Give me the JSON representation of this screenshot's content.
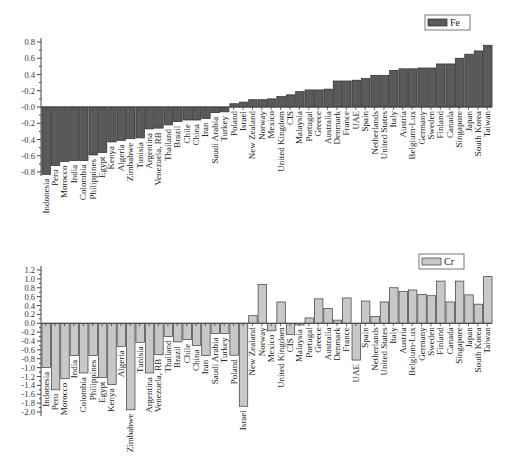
{
  "chart_data": [
    {
      "type": "bar",
      "title": "",
      "xlabel": "",
      "ylabel": "",
      "legend": {
        "label": "Fe",
        "placement": "top-right"
      },
      "color": "#5a5a5a",
      "edge_color": "#2a2a2a",
      "ylim": [
        -0.8,
        0.8
      ],
      "yticks": [
        "0.8",
        "0.6",
        "0.4",
        "-0.2",
        "-0.0",
        "-0.2",
        "-0.4",
        "-0.6",
        "-0.8"
      ],
      "ytick_values": [
        0.8,
        0.6,
        0.4,
        0.2,
        0.0,
        -0.2,
        -0.4,
        -0.6,
        -0.8
      ],
      "grid": false,
      "categories": [
        "Indonesia",
        "Peru",
        "Morocco",
        "India",
        "Colombia",
        "Philippines",
        "Egypt",
        "Kenya",
        "Algeria",
        "Zimbabwe",
        "Tunisia",
        "Argentina",
        "Venezuela, RB",
        "Thailand",
        "Brazil",
        "Chile",
        "China",
        "Iran",
        "Saudi Arabia",
        "Turkey",
        "Poland",
        "Israel",
        "New Zealand",
        "Norway",
        "Mexico",
        "United Kingdom",
        "CIS",
        "Malaysia",
        "Portugal",
        "Greece",
        "Australia",
        "Denmark",
        "France",
        "UAE",
        "Spain",
        "Netherlands",
        "United States",
        "Italy",
        "Austria",
        "Belgium-Lux",
        "Germany",
        "Sweden",
        "Finland",
        "Canada",
        "Singapore",
        "Japan",
        "South Korea",
        "Taiwan"
      ],
      "values": [
        -0.83,
        -0.72,
        -0.67,
        -0.66,
        -0.66,
        -0.59,
        -0.56,
        -0.43,
        -0.41,
        -0.39,
        -0.38,
        -0.27,
        -0.26,
        -0.22,
        -0.18,
        -0.16,
        -0.16,
        -0.14,
        -0.07,
        -0.06,
        0.04,
        0.06,
        0.09,
        0.09,
        0.1,
        0.13,
        0.15,
        0.19,
        0.21,
        0.21,
        0.22,
        0.32,
        0.32,
        0.33,
        0.35,
        0.39,
        0.39,
        0.45,
        0.47,
        0.47,
        0.48,
        0.48,
        0.53,
        0.53,
        0.6,
        0.65,
        0.69,
        0.76
      ]
    },
    {
      "type": "bar",
      "title": "",
      "xlabel": "",
      "ylabel": "",
      "legend": {
        "label": "Cr",
        "placement": "top-right"
      },
      "color": "#c8c8c8",
      "edge_color": "#3a3a3a",
      "ylim": [
        -2.0,
        1.2
      ],
      "yticks": [
        "1.2",
        "1.0",
        "0.8",
        "0.6",
        "0.4",
        "0.2",
        "0.0",
        "-0.2",
        "-0.4",
        "-0.6",
        "-0.8",
        "-1.0",
        "-1.2",
        "-1.4",
        "-1.6",
        "-1.8",
        "-2.0"
      ],
      "ytick_values": [
        1.2,
        1.0,
        0.8,
        0.6,
        0.4,
        0.2,
        0.0,
        -0.2,
        -0.4,
        -0.6,
        -0.8,
        -1.0,
        -1.2,
        -1.4,
        -1.6,
        -1.8,
        -2.0
      ],
      "grid": false,
      "categories": [
        "Indonesia",
        "Peru",
        "Morocco",
        "India",
        "Colombia",
        "Philippines",
        "Egypt",
        "Kenya",
        "Algeria",
        "Zimbabwe",
        "Tunisia",
        "Argentina",
        "Venezuela, RB",
        "Thailand",
        "Brazil",
        "Chile",
        "China",
        "Iran",
        "Saudi Arabia",
        "Turkey",
        "Poland",
        "Israel",
        "New Zealand",
        "Norway",
        "Mexico",
        "United Kingdom",
        "CIS",
        "Malaysia",
        "Portugal",
        "Greece",
        "Australia",
        "Denmark",
        "France",
        "UAE",
        "Spain",
        "Netherlands",
        "United States",
        "Italy",
        "Austria",
        "Belgium-Lux",
        "Germany",
        "Sweden",
        "Finland",
        "Canada",
        "Singapore",
        "Japan",
        "South Korea",
        "Taiwan"
      ],
      "values": [
        -1.0,
        -1.5,
        -1.25,
        -0.73,
        -1.12,
        -0.73,
        -1.22,
        -1.38,
        -0.52,
        -1.95,
        -0.43,
        -1.12,
        -0.71,
        -0.3,
        -0.42,
        -0.37,
        -0.5,
        -0.73,
        -0.23,
        -0.23,
        -0.72,
        -1.87,
        0.17,
        0.87,
        -0.17,
        0.48,
        -0.25,
        -0.04,
        0.12,
        0.55,
        0.33,
        0.07,
        0.57,
        -0.83,
        0.5,
        0.15,
        0.48,
        0.8,
        0.72,
        0.75,
        0.65,
        0.62,
        0.95,
        0.48,
        0.95,
        0.64,
        0.43,
        1.05
      ]
    }
  ]
}
